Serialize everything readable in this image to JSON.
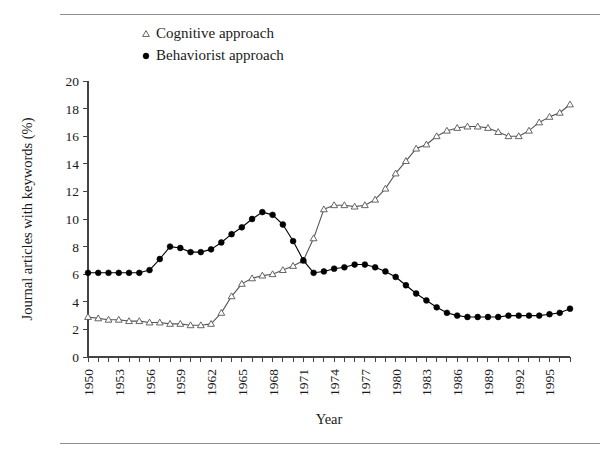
{
  "figure": {
    "rules": {
      "top_label": "top-rule",
      "bottom_label": "bottom-rule"
    }
  },
  "legend": {
    "position": "top-left-inside",
    "entries": [
      {
        "label": "Cognitive approach",
        "marker": "open-triangle",
        "color": "#555555"
      },
      {
        "label": "Behaviorist approach",
        "marker": "filled-circle",
        "color": "#000000"
      }
    ]
  },
  "chart_data": {
    "type": "line",
    "title": "",
    "xlabel": "Year",
    "ylabel": "Journal articles with keywords (%)",
    "xlim": [
      1950,
      1997
    ],
    "ylim": [
      0,
      20
    ],
    "yticks": [
      0,
      2,
      4,
      6,
      8,
      10,
      12,
      14,
      16,
      18,
      20
    ],
    "xticks_labeled": [
      1950,
      1953,
      1956,
      1959,
      1962,
      1965,
      1968,
      1971,
      1974,
      1977,
      1980,
      1983,
      1986,
      1989,
      1992,
      1995
    ],
    "xtick_label_rotation": -90,
    "grid": false,
    "x": [
      1950,
      1951,
      1952,
      1953,
      1954,
      1955,
      1956,
      1957,
      1958,
      1959,
      1960,
      1961,
      1962,
      1963,
      1964,
      1965,
      1966,
      1967,
      1968,
      1969,
      1970,
      1971,
      1972,
      1973,
      1974,
      1975,
      1976,
      1977,
      1978,
      1979,
      1980,
      1981,
      1982,
      1983,
      1984,
      1985,
      1986,
      1987,
      1988,
      1989,
      1990,
      1991,
      1992,
      1993,
      1994,
      1995,
      1996,
      1997
    ],
    "series": [
      {
        "name": "Cognitive approach",
        "marker": "open-triangle",
        "color": "#555555",
        "values": [
          2.9,
          2.8,
          2.7,
          2.7,
          2.6,
          2.6,
          2.5,
          2.5,
          2.4,
          2.4,
          2.3,
          2.3,
          2.4,
          3.2,
          4.4,
          5.3,
          5.7,
          5.9,
          6.0,
          6.3,
          6.6,
          7.0,
          8.6,
          10.7,
          11.0,
          11.0,
          10.9,
          11.0,
          11.4,
          12.2,
          13.3,
          14.2,
          15.1,
          15.4,
          16.0,
          16.4,
          16.6,
          16.7,
          16.7,
          16.6,
          16.3,
          16.0,
          16.0,
          16.4,
          17.0,
          17.4,
          17.7,
          18.3
        ]
      },
      {
        "name": "Behaviorist approach",
        "marker": "filled-circle",
        "color": "#000000",
        "values": [
          6.1,
          6.1,
          6.1,
          6.1,
          6.1,
          6.1,
          6.3,
          7.1,
          8.0,
          7.9,
          7.6,
          7.6,
          7.8,
          8.3,
          8.9,
          9.4,
          10.0,
          10.5,
          10.3,
          9.6,
          8.4,
          7.0,
          6.1,
          6.2,
          6.4,
          6.5,
          6.7,
          6.7,
          6.5,
          6.2,
          5.8,
          5.2,
          4.6,
          4.1,
          3.6,
          3.2,
          3.0,
          2.9,
          2.9,
          2.9,
          2.9,
          3.0,
          3.0,
          3.0,
          3.0,
          3.1,
          3.2,
          3.5
        ]
      }
    ]
  }
}
